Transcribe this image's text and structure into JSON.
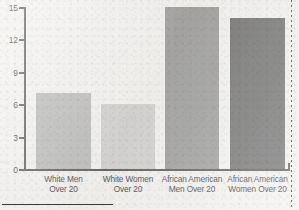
{
  "chart_data": {
    "type": "bar",
    "title": "",
    "xlabel": "",
    "ylabel": "",
    "ylim": [
      0,
      15
    ],
    "yticks": [
      "0",
      "3",
      "6",
      "9",
      "12",
      "15"
    ],
    "grid": false,
    "legend": "none",
    "categories": [
      "White Men Over 20",
      "White Women Over 20",
      "African American Men Over 20",
      "African American Women Over 20"
    ],
    "values": [
      7,
      6,
      15,
      14
    ],
    "bar_colors": [
      "#adadad",
      "#c9c9c9",
      "#8a8a8a",
      "#555555"
    ]
  },
  "axis": {
    "ticks": [
      {
        "label": "15",
        "value": 15
      },
      {
        "label": "12",
        "value": 12
      },
      {
        "label": "9",
        "value": 9
      },
      {
        "label": "6",
        "value": 6
      },
      {
        "label": "3",
        "value": 3
      },
      {
        "label": "0",
        "value": 0
      }
    ]
  },
  "bars": [
    {
      "value": 7,
      "line1": "White Men",
      "line2": "Over 20",
      "color": "#adadad"
    },
    {
      "value": 6,
      "line1": "White Women",
      "line2": "Over 20",
      "color": "#c9c9c9"
    },
    {
      "value": 15,
      "line1": "African American",
      "line2": "Men Over 20",
      "color": "#8a8a8a"
    },
    {
      "value": 14,
      "line1": "African American",
      "line2": "Women Over 20",
      "color": "#555555"
    }
  ],
  "colors": {
    "background": "#f1f0ee",
    "axis": "#3a3a38",
    "text": "#17171a"
  }
}
